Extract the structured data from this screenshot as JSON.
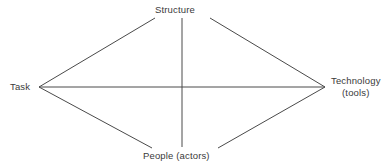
{
  "diagram": {
    "type": "leavitt-diamond",
    "background_color": "#ffffff",
    "line_color": "#4a4a4a",
    "text_color": "#3a3a3a",
    "nodes": {
      "structure": {
        "label": "Structure",
        "position": "top"
      },
      "task": {
        "label": "Task",
        "position": "left"
      },
      "technology": {
        "label": "Technology",
        "sublabel": "(tools)",
        "position": "right"
      },
      "people": {
        "label": "People (actors)",
        "position": "bottom"
      }
    },
    "edges": [
      {
        "from": "task",
        "to": "structure"
      },
      {
        "from": "structure",
        "to": "technology"
      },
      {
        "from": "task",
        "to": "people"
      },
      {
        "from": "people",
        "to": "technology"
      },
      {
        "from": "task",
        "to": "technology"
      },
      {
        "from": "structure",
        "to": "people"
      }
    ]
  }
}
